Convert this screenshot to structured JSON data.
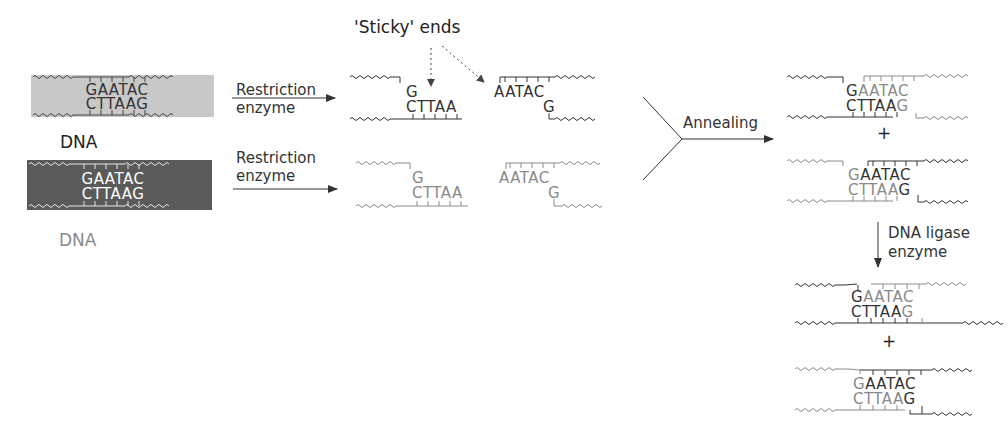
{
  "figure": {
    "colors": {
      "light_box": "#c8c8c8",
      "dark_box": "#5a5a5a",
      "dark_strand": "#333333",
      "grey_strand": "#8a8a8a",
      "arrow": "#333333"
    }
  },
  "inputs": [
    {
      "label": "DNA",
      "top_seq": "GAATAC",
      "bottom_seq": "CTTAAG",
      "shade": "light"
    },
    {
      "label": "DNA",
      "top_seq": "GAATAC",
      "bottom_seq": "CTTAAG",
      "shade": "dark"
    }
  ],
  "steps": {
    "restriction_1": {
      "line1": "Restriction",
      "line2": "enzyme"
    },
    "restriction_2": {
      "line1": "Restriction",
      "line2": "enzyme"
    },
    "annealing": "Annealing",
    "ligase": {
      "line1": "DNA ligase",
      "line2": "enzyme"
    }
  },
  "annotation": {
    "sticky_ends": "'Sticky' ends"
  },
  "cut_fragments": [
    {
      "left_top": "G",
      "left_bottom": "CTTAA",
      "right_top": "AATAC",
      "right_bottom": "G",
      "shade": "dark"
    },
    {
      "left_top": "G",
      "left_bottom": "CTTAA",
      "right_top": "AATAC",
      "right_bottom": "G",
      "shade": "grey"
    }
  ],
  "annealed": {
    "product_1": {
      "top_a": "G",
      "top_b": "AATAC",
      "bottom_a": "CTTAA",
      "bottom_b": "G"
    },
    "plus": "+",
    "product_2": {
      "top_a": "G",
      "top_b": "AATAC",
      "bottom_a": "CTTAA",
      "bottom_b": "G"
    }
  },
  "ligated": {
    "product_1": {
      "top_a": "G",
      "top_b": "AATAC",
      "bottom_a": "CTTAA",
      "bottom_b": "G"
    },
    "plus": "+",
    "product_2": {
      "top_a": "G",
      "top_b": "AATAC",
      "bottom_a": "CTTAA",
      "bottom_b": "G"
    }
  }
}
